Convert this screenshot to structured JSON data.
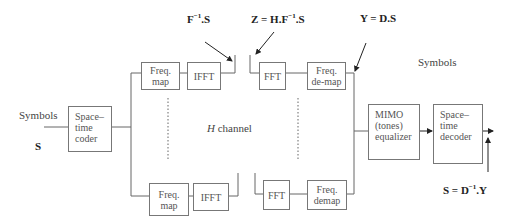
{
  "diagram": {
    "input": {
      "label": "Symbols",
      "symbol": "S"
    },
    "output_label": "Symbols",
    "channel_label_italic": "H",
    "channel_label": " channel",
    "blocks": {
      "coder": [
        "Space–",
        "time",
        "coder"
      ],
      "freq_map_top": [
        "Freq.",
        "map"
      ],
      "ifft_top": "IFFT",
      "fft_top": "FFT",
      "freq_demap_top": [
        "Freq.",
        "de-map"
      ],
      "freq_map_bottom": [
        "Freq.",
        "map"
      ],
      "ifft_bottom": "IFFT",
      "fft_bottom": "FFT",
      "freq_demap_bottom": [
        "Freq.",
        "demap"
      ],
      "equalizer": [
        "MIMO",
        "(tones)",
        "equalizer"
      ],
      "decoder": [
        "Space–",
        "time",
        "decoder"
      ]
    },
    "equations": {
      "after_ifft": {
        "base": "F",
        "sup": "−1",
        "tail": ".S"
      },
      "after_channel": {
        "base": "Z = H.F",
        "sup": "−1",
        "tail": ".S"
      },
      "after_demap": {
        "base": "Y = D.S"
      },
      "output": {
        "base": "S = D",
        "sup": "−1",
        "tail": ".Y"
      }
    }
  }
}
